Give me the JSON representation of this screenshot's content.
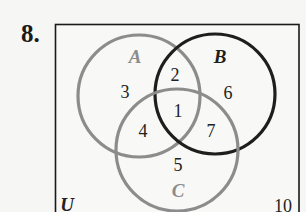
{
  "problem_number": "8.",
  "diagram": {
    "type": "venn-3-set",
    "universe_label": "U",
    "universe_outside_value": "10",
    "sets": [
      {
        "name": "A",
        "color": "#8c8c8c"
      },
      {
        "name": "B",
        "color": "#1e1e1e"
      },
      {
        "name": "C",
        "color": "#8c8c8c"
      }
    ],
    "regions": {
      "A_only": "3",
      "A_and_B_only": "2",
      "A_and_B_and_C": "1",
      "B_only": "6",
      "A_and_C_only": "4",
      "B_and_C_only": "7",
      "C_only": "5",
      "outside": "10"
    }
  }
}
